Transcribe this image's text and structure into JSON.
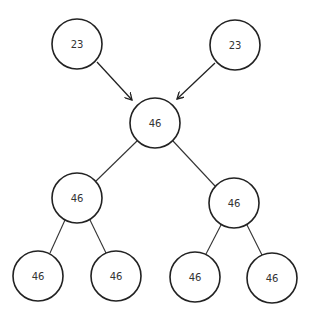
{
  "diagram": {
    "type": "tree",
    "nodes": [
      {
        "id": "input-left",
        "label": "23",
        "cx": 77,
        "cy": 44,
        "r": 25
      },
      {
        "id": "input-right",
        "label": "23",
        "cx": 235,
        "cy": 45,
        "r": 25
      },
      {
        "id": "root",
        "label": "46",
        "cx": 155,
        "cy": 123,
        "r": 25
      },
      {
        "id": "mid-left",
        "label": "46",
        "cx": 77,
        "cy": 198,
        "r": 25
      },
      {
        "id": "mid-right",
        "label": "46",
        "cx": 234,
        "cy": 203,
        "r": 25
      },
      {
        "id": "leaf-1",
        "label": "46",
        "cx": 38,
        "cy": 276,
        "r": 25
      },
      {
        "id": "leaf-2",
        "label": "46",
        "cx": 116,
        "cy": 276,
        "r": 25
      },
      {
        "id": "leaf-3",
        "label": "46",
        "cx": 195,
        "cy": 277,
        "r": 25
      },
      {
        "id": "leaf-4",
        "label": "46",
        "cx": 272,
        "cy": 278,
        "r": 25
      }
    ],
    "edges": [
      {
        "from": "input-left",
        "to": "root",
        "directed": true
      },
      {
        "from": "input-right",
        "to": "root",
        "directed": true
      },
      {
        "from": "root",
        "to": "mid-left",
        "directed": false
      },
      {
        "from": "root",
        "to": "mid-right",
        "directed": false
      },
      {
        "from": "mid-left",
        "to": "leaf-1",
        "directed": false
      },
      {
        "from": "mid-left",
        "to": "leaf-2",
        "directed": false
      },
      {
        "from": "mid-right",
        "to": "leaf-3",
        "directed": false
      },
      {
        "from": "mid-right",
        "to": "leaf-4",
        "directed": false
      }
    ]
  }
}
